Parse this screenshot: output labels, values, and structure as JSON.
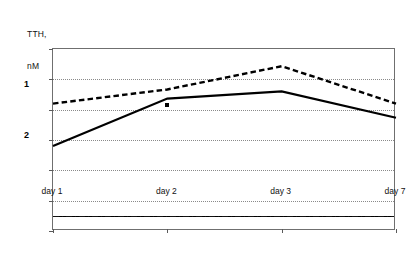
{
  "chart_data": {
    "type": "line",
    "title": "",
    "ylabel": "TTH, nM",
    "ylabel_lines": [
      "TTH,",
      "nM"
    ],
    "xlabel": "",
    "categories": [
      "day 1",
      "day 2",
      "day 3",
      "day 7"
    ],
    "ylim": [
      0,
      1.8
    ],
    "ytick_labels": [
      "0",
      "0.3",
      "0.6",
      "0.9",
      "1.2",
      "1.5",
      "1.8"
    ],
    "ytick_values": [
      0,
      0.3,
      0.6,
      0.9,
      1.2,
      1.5,
      1.8
    ],
    "grid": true,
    "legend_position": "inline-labels",
    "series": [
      {
        "name": "1",
        "label": "1",
        "style": "dashed",
        "color": "#000000",
        "values": [
          1.26,
          1.4,
          1.63,
          1.26
        ]
      },
      {
        "name": "2",
        "label": "2",
        "style": "solid",
        "color": "#000000",
        "values": [
          0.84,
          1.31,
          1.38,
          1.12
        ]
      }
    ],
    "reference_line": {
      "value": 0.15,
      "style": "dash-dot",
      "color": "#000000"
    },
    "annotations": [
      {
        "text": "*",
        "marker": "asterisk",
        "series": "2",
        "category": "day 2",
        "value": 1.25
      }
    ]
  }
}
